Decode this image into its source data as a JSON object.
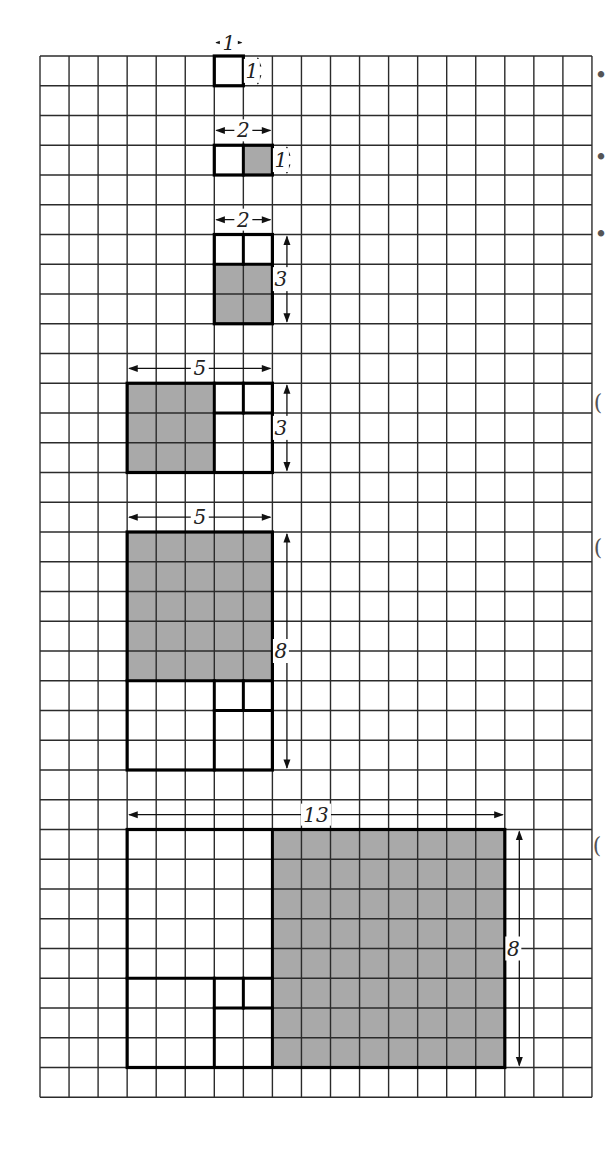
{
  "figure": {
    "grid": {
      "cols": 19,
      "rows": 35,
      "left": 40,
      "top": 56,
      "cell_w": 29.05,
      "cell_h": 29.75
    },
    "colors": {
      "shade": "#a9a9a9",
      "grid": "#2b2b2b",
      "outline": "#000000",
      "paper": "#ffffff"
    },
    "blocks": [
      {
        "id": "rect-1x1",
        "x": 6,
        "y": 0,
        "w": 1,
        "h": 1,
        "shaded": [],
        "lines": [],
        "width_label": {
          "text": "1",
          "row": -0.45
        },
        "height_label": {
          "text": "1",
          "col": 7.5
        }
      },
      {
        "id": "rect-2x1",
        "x": 6,
        "y": 3,
        "w": 2,
        "h": 1,
        "shaded": [
          [
            7,
            3,
            1,
            1
          ]
        ],
        "lines": [
          [
            7,
            3,
            7,
            4
          ]
        ],
        "width_label": {
          "text": "2",
          "row": 2.5
        },
        "height_label": {
          "text": "1",
          "col": 8.5
        }
      },
      {
        "id": "rect-2x3",
        "x": 6,
        "y": 6,
        "w": 2,
        "h": 3,
        "shaded": [
          [
            6,
            7,
            2,
            2
          ]
        ],
        "lines": [
          [
            6,
            7,
            8,
            7
          ],
          [
            7,
            6,
            7,
            7
          ]
        ],
        "width_label": {
          "text": "2",
          "row": 5.5
        },
        "height_label": {
          "text": "3",
          "col": 8.5
        }
      },
      {
        "id": "rect-5x3",
        "x": 3,
        "y": 11,
        "w": 5,
        "h": 3,
        "shaded": [
          [
            3,
            11,
            3,
            3
          ]
        ],
        "lines": [
          [
            6,
            11,
            6,
            14
          ],
          [
            6,
            12,
            8,
            12
          ],
          [
            7,
            11,
            7,
            12
          ]
        ],
        "width_label": {
          "text": "5",
          "row": 10.5
        },
        "height_label": {
          "text": "3",
          "col": 8.5
        }
      },
      {
        "id": "rect-5x8",
        "x": 3,
        "y": 16,
        "w": 5,
        "h": 8,
        "shaded": [
          [
            3,
            16,
            5,
            5
          ]
        ],
        "lines": [
          [
            3,
            21,
            8,
            21
          ],
          [
            6,
            21,
            6,
            24
          ],
          [
            6,
            22,
            8,
            22
          ],
          [
            7,
            21,
            7,
            22
          ]
        ],
        "width_label": {
          "text": "5",
          "row": 15.5
        },
        "height_label": {
          "text": "8",
          "col": 8.5
        }
      },
      {
        "id": "rect-13x8",
        "x": 3,
        "y": 26,
        "w": 13,
        "h": 8,
        "shaded": [
          [
            8,
            26,
            8,
            8
          ]
        ],
        "lines": [
          [
            8,
            26,
            8,
            34
          ],
          [
            3,
            31,
            8,
            31
          ],
          [
            6,
            31,
            6,
            34
          ],
          [
            6,
            32,
            8,
            32
          ],
          [
            7,
            31,
            7,
            32
          ]
        ],
        "width_label": {
          "text": "13",
          "row": 25.5
        },
        "height_label": {
          "text": "8",
          "col": 16.5
        }
      }
    ],
    "margin_marks": [
      {
        "glyph": "•",
        "x": 601,
        "y": 83
      },
      {
        "glyph": "•",
        "x": 601,
        "y": 165
      },
      {
        "glyph": "•",
        "x": 601,
        "y": 242
      },
      {
        "glyph": "(",
        "x": 598,
        "y": 410
      },
      {
        "glyph": "(",
        "x": 598,
        "y": 555
      },
      {
        "glyph": "(",
        "x": 597,
        "y": 853
      }
    ]
  }
}
